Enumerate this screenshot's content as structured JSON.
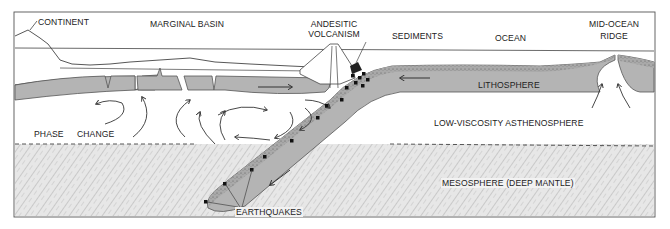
{
  "diagram": {
    "type": "cross-section",
    "labels": {
      "continent": "CONTINENT",
      "marginal_basin": "MARGINAL BASIN",
      "andesitic_volcanism_line1": "ANDESITIC",
      "andesitic_volcanism_line2": "VOLCANISM",
      "sediments": "SEDIMENTS",
      "ocean": "OCEAN",
      "mid_ocean_ridge_line1": "MID-OCEAN",
      "mid_ocean_ridge_line2": "RIDGE",
      "lithosphere": "LITHOSPHERE",
      "phase": "PHASE",
      "change": "CHANGE",
      "asthenosphere": "LOW-VISCOSITY ASTHENOSPHERE",
      "mesosphere": "MESOSPHERE (DEEP MANTLE)",
      "earthquakes": "EARTHQUAKES"
    },
    "colors": {
      "plate_fill": "#b4b4b4",
      "plate_stroke": "#555555",
      "mesosphere_fill": "#e6e6e6",
      "ink": "#333333",
      "background": "#ffffff",
      "earthquake_marker": "#111111"
    }
  }
}
